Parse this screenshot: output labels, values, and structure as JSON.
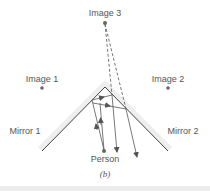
{
  "diagram": {
    "labels": {
      "image1": "Image 1",
      "image2": "Image 2",
      "image3": "Image 3",
      "mirror1": "Mirror 1",
      "mirror2": "Mirror 2",
      "person": "Person",
      "caption": "(b)"
    },
    "colors": {
      "line": "#444444",
      "dot": "#666666",
      "text": "#555555",
      "band": "#ececec"
    }
  }
}
